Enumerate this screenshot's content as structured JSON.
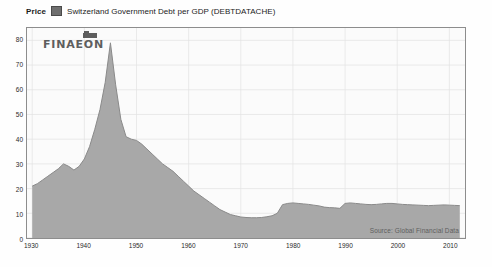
{
  "header": {
    "price_label": "Price",
    "series_title": "Switzerland Government Debt per GDP (DEBTDATACHE)",
    "swatch_color": "#6e6e6e"
  },
  "watermark": {
    "text": "FINAEON"
  },
  "source": {
    "text": "Source:  Global Financial Data"
  },
  "chart_data": {
    "type": "area",
    "title": "Switzerland Government Debt per GDP (DEBTDATACHE)",
    "xlabel": "",
    "ylabel": "Price",
    "xlim": [
      1929,
      2013
    ],
    "ylim": [
      0,
      85
    ],
    "grid": true,
    "legend_position": "top-left",
    "legend": [
      "Switzerland Government Debt per GDP (DEBTDATACHE)"
    ],
    "area_fill": "#a8a8a8",
    "line_color": "#8a8a8a",
    "background": "#fbfbfb",
    "xticks": [
      1930,
      1940,
      1950,
      1960,
      1970,
      1980,
      1990,
      2000,
      2010
    ],
    "yticks": [
      0,
      10,
      20,
      30,
      40,
      50,
      60,
      70,
      80
    ],
    "series": [
      {
        "name": "Switzerland Government Debt per GDP (DEBTDATACHE)",
        "x": [
          1930,
          1931,
          1932,
          1933,
          1934,
          1935,
          1936,
          1937,
          1938,
          1939,
          1940,
          1941,
          1942,
          1943,
          1944,
          1945,
          1946,
          1947,
          1948,
          1949,
          1950,
          1951,
          1952,
          1953,
          1954,
          1955,
          1956,
          1957,
          1958,
          1959,
          1960,
          1961,
          1962,
          1963,
          1964,
          1965,
          1966,
          1967,
          1968,
          1969,
          1970,
          1971,
          1972,
          1973,
          1974,
          1975,
          1976,
          1977,
          1978,
          1979,
          1980,
          1981,
          1982,
          1983,
          1984,
          1985,
          1986,
          1987,
          1988,
          1989,
          1990,
          1991,
          1992,
          1993,
          1994,
          1995,
          1996,
          1997,
          1998,
          1999,
          2000,
          2001,
          2002,
          2003,
          2004,
          2005,
          2006,
          2007,
          2008,
          2009,
          2010,
          2011,
          2012
        ],
        "values": [
          21,
          22,
          23.5,
          25,
          26.5,
          28,
          30,
          29,
          27.5,
          29,
          32,
          37,
          44,
          52,
          63,
          79,
          62,
          48,
          41,
          40,
          39.5,
          38,
          36,
          34,
          32,
          30,
          28.5,
          27,
          25,
          23,
          21,
          19,
          17.5,
          16,
          14.5,
          13,
          11.5,
          10.5,
          9.5,
          9,
          8.5,
          8.3,
          8.2,
          8.2,
          8.3,
          8.6,
          9,
          10,
          13.5,
          14,
          14.2,
          14,
          13.8,
          13.6,
          13.3,
          13,
          12.5,
          12.3,
          12.2,
          12,
          14,
          14.2,
          14,
          13.8,
          13.6,
          13.5,
          13.6,
          13.8,
          14,
          14,
          13.8,
          13.6,
          13.5,
          13.4,
          13.3,
          13.2,
          13.1,
          13.2,
          13.3,
          13.4,
          13.3,
          13.2,
          13.1
        ]
      }
    ]
  }
}
